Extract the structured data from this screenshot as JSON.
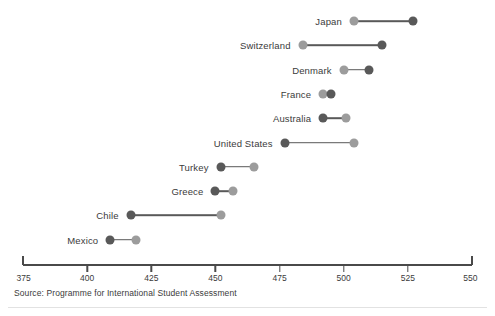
{
  "chart_data": {
    "type": "dumbbell",
    "title": "",
    "subtitle": "",
    "xlabel": "",
    "ylabel": "",
    "xlim": [
      375,
      550
    ],
    "xticks": [
      375,
      400,
      425,
      450,
      475,
      500,
      525,
      550
    ],
    "xtick_labels": [
      "375",
      "400",
      "425",
      "450",
      "475",
      "500",
      "525",
      "550"
    ],
    "grid": false,
    "legend_position": "none",
    "categories": [
      "Japan",
      "Switzerland",
      "Denmark",
      "France",
      "Australia",
      "United States",
      "Turkey",
      "Greece",
      "Chile",
      "Mexico"
    ],
    "series": [
      {
        "name": "light-marker",
        "color": "#9c9c9c",
        "values": [
          504,
          484,
          500,
          492,
          501,
          504,
          465,
          457,
          452,
          419
        ]
      },
      {
        "name": "dark-marker",
        "color": "#595959",
        "values": [
          527,
          515,
          510,
          495,
          492,
          477,
          452,
          450,
          417,
          409
        ]
      }
    ],
    "rows": [
      {
        "label": "Japan",
        "light": 504,
        "dark": 527
      },
      {
        "label": "Switzerland",
        "light": 484,
        "dark": 515
      },
      {
        "label": "Denmark",
        "light": 500,
        "dark": 510
      },
      {
        "label": "France",
        "light": 492,
        "dark": 495
      },
      {
        "label": "Australia",
        "light": 501,
        "dark": 492
      },
      {
        "label": "United States",
        "light": 504,
        "dark": 477
      },
      {
        "label": "Turkey",
        "light": 465,
        "dark": 452
      },
      {
        "label": "Greece",
        "light": 457,
        "dark": 450
      },
      {
        "label": "Chile",
        "light": 452,
        "dark": 417
      },
      {
        "label": "Mexico",
        "light": 419,
        "dark": 409
      }
    ]
  },
  "source_note": "Source: Programme for International Student Assessment",
  "colors": {
    "dark_marker": "#595959",
    "light_marker": "#9c9c9c",
    "axis": "#4a4a4a",
    "text": "#3b3b3b",
    "background": "#ffffff"
  }
}
